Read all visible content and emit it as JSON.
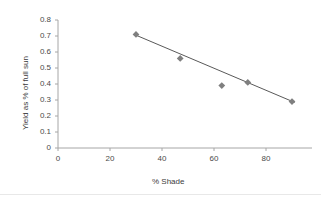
{
  "chart_data": {
    "type": "scatter",
    "title": "",
    "xlabel": "% Shade",
    "ylabel": "Yield as % of full sun",
    "xlim": [
      0,
      100
    ],
    "ylim": [
      0,
      0.8
    ],
    "grid": false,
    "legend": "none",
    "x_ticks": [
      "0",
      "20",
      "40",
      "60",
      "80"
    ],
    "x_tick_values": [
      0,
      20,
      40,
      60,
      80
    ],
    "y_ticks": [
      "0",
      "0.1",
      "0.2",
      "0.3",
      "0.4",
      "0.5",
      "0.6",
      "0.7",
      "0.8"
    ],
    "y_tick_values": [
      0,
      0.1,
      0.2,
      0.3,
      0.4,
      0.5,
      0.6,
      0.7,
      0.8
    ],
    "series": [
      {
        "name": "Yield vs Shade",
        "marker": "diamond",
        "marker_color": "#7f7f7f",
        "points": [
          {
            "x": 30,
            "y": 0.71
          },
          {
            "x": 47,
            "y": 0.56
          },
          {
            "x": 63,
            "y": 0.39
          },
          {
            "x": 73,
            "y": 0.41
          },
          {
            "x": 90,
            "y": 0.29
          }
        ]
      }
    ],
    "trendline": {
      "type": "linear",
      "color": "#595959",
      "x_start": 30,
      "y_start": 0.705,
      "x_end": 91,
      "y_end": 0.285
    }
  },
  "colors": {
    "axis": "#a6a6a6",
    "marker": "#7f7f7f",
    "trendline": "#595959",
    "text": "#404040",
    "background": "#ffffff",
    "rule": "#e8e8e8"
  }
}
